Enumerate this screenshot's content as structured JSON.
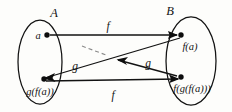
{
  "figure": {
    "kind": "set-mapping-diagram",
    "background_color": "#fdfdfb",
    "ink_color": "#121212",
    "dashed_color": "#8a8a8a"
  },
  "sets": {
    "left": {
      "label": "A",
      "elements": [
        {
          "id": "a",
          "label": "a"
        },
        {
          "id": "gfa",
          "label": "g(f(a))"
        }
      ]
    },
    "right": {
      "label": "B",
      "elements": [
        {
          "id": "fa",
          "label": "f(a)"
        },
        {
          "id": "fgfa",
          "label": "f(g(f(a)))"
        }
      ]
    }
  },
  "arrows": [
    {
      "id": "f-top",
      "label": "f",
      "from": "a",
      "to": "fa"
    },
    {
      "id": "g-upper",
      "label": "g",
      "from": "fa",
      "to": "gfa"
    },
    {
      "id": "f-bottom",
      "label": "f",
      "from": "gfa",
      "to": "fgfa"
    },
    {
      "id": "g-lower",
      "label": "g",
      "from": "fgfa",
      "to": "middle"
    }
  ],
  "dashed_segment": {
    "id": "dashed-hint",
    "label": ""
  }
}
